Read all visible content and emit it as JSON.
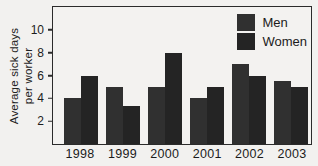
{
  "figure": {
    "ylabel_line1": "Average sick days",
    "ylabel_line2": "per worker"
  },
  "colors": {
    "background": "#f2f1ef",
    "frame": "#2b2b2b",
    "text": "#1d1d1d",
    "bar_men": "#303030",
    "bar_women": "#242424"
  },
  "chart_data": {
    "type": "bar",
    "title": "",
    "xlabel": "",
    "ylabel": "Average sick days per worker",
    "categories": [
      "1998",
      "1999",
      "2000",
      "2001",
      "2002",
      "2003"
    ],
    "series": [
      {
        "name": "Men",
        "color": "#303030",
        "values": [
          4,
          5,
          5,
          4,
          7,
          5.5
        ]
      },
      {
        "name": "Women",
        "color": "#242424",
        "values": [
          6,
          3.3,
          8,
          5,
          6,
          5
        ]
      }
    ],
    "yticks": [
      2,
      4,
      6,
      8,
      10
    ],
    "ylim": [
      0,
      12
    ],
    "grid": false,
    "legend_position": "top-right-inside"
  }
}
